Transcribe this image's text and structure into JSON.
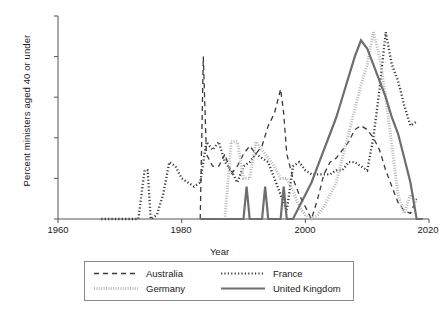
{
  "chart_data": {
    "type": "line",
    "title": "",
    "xlabel": "Year",
    "ylabel": "Percent ministers aged 40 or under",
    "xlim": [
      1960,
      2020
    ],
    "ylim": [
      0,
      25
    ],
    "xticks": [
      1960,
      1980,
      2000,
      2020
    ],
    "yticks": [
      0,
      5,
      10,
      15,
      20,
      25
    ],
    "grid": false,
    "legend_position": "below-center",
    "series": [
      {
        "name": "Australia",
        "style": "dashed",
        "color": "#3a3a3a",
        "x": [
          1983,
          1983.5,
          1984,
          1985,
          1986,
          1987,
          1988,
          1989,
          1990,
          1991,
          1992,
          1993,
          1994,
          1995,
          1996,
          1996.5,
          1997,
          1998,
          1999,
          2000,
          2001,
          2002,
          2003,
          2004,
          2005,
          2006,
          2007,
          2008,
          2009,
          2010,
          2011,
          2012,
          2013,
          2014,
          2015,
          2016,
          2017,
          2018
        ],
        "y": [
          0,
          20,
          8,
          6.5,
          6.5,
          8,
          5.5,
          6.5,
          8,
          9,
          8,
          9,
          11.5,
          13,
          16,
          13,
          8,
          5,
          3,
          1.5,
          0,
          2.5,
          5.5,
          7,
          7.5,
          8.5,
          9.5,
          11,
          11.5,
          11,
          10,
          8.5,
          6,
          4,
          2,
          1,
          0.7,
          2.5
        ]
      },
      {
        "name": "France",
        "style": "dotted",
        "color": "#3a3a3a",
        "x": [
          1967,
          1968,
          1969,
          1970,
          1971,
          1972,
          1973,
          1974,
          1974.5,
          1975,
          1976,
          1977,
          1978,
          1979,
          1980,
          1981,
          1982,
          1983,
          1984,
          1985,
          1986,
          1987,
          1988,
          1989,
          1990,
          1991,
          1992,
          1993,
          1994,
          1995,
          1996,
          1997,
          1998,
          1999,
          2000,
          2001,
          2002,
          2003,
          2004,
          2005,
          2006,
          2007,
          2008,
          2009,
          2010,
          2011,
          2012,
          2013,
          2014,
          2015,
          2016,
          2017,
          2018
        ],
        "y": [
          0,
          0,
          0,
          0,
          0,
          0,
          0,
          6,
          6,
          0,
          0.5,
          3,
          7,
          6.5,
          5,
          4.5,
          4,
          4.5,
          9.5,
          8.5,
          9.5,
          7,
          6,
          4.5,
          6.5,
          7,
          8,
          7.5,
          7,
          5,
          3,
          1,
          6.5,
          7,
          6,
          5.5,
          5.5,
          5.5,
          5.5,
          6,
          6,
          7,
          7,
          6.5,
          6,
          10,
          16,
          23,
          19,
          17,
          14,
          11.5,
          12
        ]
      },
      {
        "name": "Germany",
        "style": "fine-dotted",
        "color": "#b9b9b9",
        "x": [
          1987,
          1988,
          1989,
          1990,
          1991,
          1992,
          1993,
          1994,
          1995,
          1996,
          1997,
          1998,
          1999,
          2000,
          2001,
          2002,
          2003,
          2004,
          2005,
          2006,
          2007,
          2008,
          2009,
          2010,
          2011,
          2012,
          2013,
          2014,
          2015,
          2016,
          2017,
          2018
        ],
        "y": [
          0,
          9.5,
          9.5,
          5,
          5,
          9.5,
          8.5,
          7.5,
          6.5,
          5,
          5,
          3.5,
          1.5,
          0.5,
          0,
          0.5,
          1.5,
          3,
          4.5,
          7.5,
          10.5,
          13.5,
          16.5,
          19,
          23,
          20,
          15,
          9,
          3,
          0.7,
          3,
          2
        ]
      },
      {
        "name": "United Kingdom",
        "style": "solid",
        "color": "#6e6e6e",
        "x": [
          1983,
          1984,
          1985,
          1986,
          1987,
          1988,
          1989,
          1990,
          1990.5,
          1991,
          1992,
          1993,
          1993.5,
          1994,
          1995,
          1996,
          1996.5,
          1997,
          1998,
          1999,
          2000,
          2001,
          2002,
          2003,
          2004,
          2005,
          2006,
          2007,
          2008,
          2009,
          2010,
          2011,
          2012,
          2013,
          2014,
          2015,
          2016,
          2017,
          2018,
          2019
        ],
        "y": [
          0,
          0,
          0,
          0,
          0,
          0,
          0,
          0,
          4,
          0,
          0,
          0,
          4,
          0,
          0,
          0,
          4,
          0,
          0,
          1.5,
          3,
          4.5,
          6.5,
          8.5,
          10.5,
          12.5,
          15,
          17.5,
          20,
          22,
          21,
          19,
          17,
          15,
          12.5,
          10.5,
          7.5,
          4.5,
          0,
          0
        ]
      }
    ]
  },
  "axes": {
    "xtick_labels": [
      "1960",
      "1980",
      "2000",
      "2020"
    ],
    "ytick_labels": [
      "0",
      "5",
      "10",
      "15",
      "20",
      "25"
    ],
    "xlabel": "Year",
    "ylabel": "Percent ministers aged 40 or under"
  },
  "legend": {
    "entries": [
      {
        "label": "Australia",
        "style": "dashed",
        "color": "#3a3a3a"
      },
      {
        "label": "France",
        "style": "dotted",
        "color": "#3a3a3a"
      },
      {
        "label": "Germany",
        "style": "fine-dotted",
        "color": "#b9b9b9"
      },
      {
        "label": "United Kingdom",
        "style": "solid",
        "color": "#6e6e6e"
      }
    ]
  }
}
